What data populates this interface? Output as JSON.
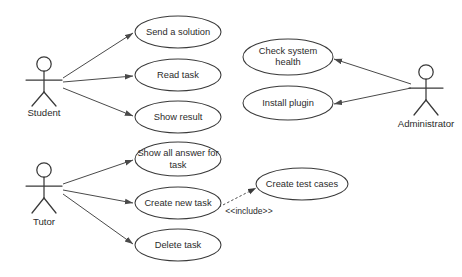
{
  "diagram": {
    "type": "uml-use-case-diagram",
    "background_color": "#ffffff",
    "stroke_color": "#3a3a3a",
    "text_color": "#2b2b2b",
    "actors": [
      {
        "id": "student",
        "label": "Student",
        "x": 44,
        "y": 78,
        "label_x": 44,
        "label_y": 113
      },
      {
        "id": "tutor",
        "label": "Tutor",
        "x": 44,
        "y": 183,
        "label_x": 44,
        "label_y": 222
      },
      {
        "id": "administrator",
        "label": "Administrator",
        "x": 426,
        "y": 85,
        "label_x": 426,
        "label_y": 124
      }
    ],
    "use_cases": [
      {
        "id": "send-a-solution",
        "label": "Send a solution",
        "lines": [
          "Send a solution"
        ],
        "cx": 178,
        "cy": 32,
        "rx": 43,
        "ry": 16
      },
      {
        "id": "read-task",
        "label": "Read task",
        "lines": [
          "Read task"
        ],
        "cx": 178,
        "cy": 75,
        "rx": 43,
        "ry": 16
      },
      {
        "id": "show-result",
        "label": "Show result",
        "lines": [
          "Show result"
        ],
        "cx": 178,
        "cy": 117,
        "rx": 43,
        "ry": 16
      },
      {
        "id": "check-system-health",
        "label": "Check system health",
        "lines": [
          "Check system",
          "health"
        ],
        "cx": 288,
        "cy": 57,
        "rx": 45,
        "ry": 18
      },
      {
        "id": "install-plugin",
        "label": "Install plugin",
        "lines": [
          "Install plugin"
        ],
        "cx": 288,
        "cy": 103,
        "rx": 45,
        "ry": 17
      },
      {
        "id": "show-all-answer-for-task",
        "label": "Show all answer for task",
        "lines": [
          "Show all answer for",
          "task"
        ],
        "cx": 178,
        "cy": 159,
        "rx": 43,
        "ry": 17
      },
      {
        "id": "create-new-task",
        "label": "Create new task",
        "lines": [
          "Create new task"
        ],
        "cx": 178,
        "cy": 203,
        "rx": 43,
        "ry": 16
      },
      {
        "id": "delete-task",
        "label": "Delete task",
        "lines": [
          "Delete task"
        ],
        "cx": 178,
        "cy": 245,
        "rx": 43,
        "ry": 16
      },
      {
        "id": "create-test-cases",
        "label": "Create test cases",
        "lines": [
          "Create test cases"
        ],
        "cx": 302,
        "cy": 184,
        "rx": 46,
        "ry": 16
      }
    ],
    "associations": [
      {
        "id": "student-to-send-a-solution",
        "from": "student",
        "to": "send-a-solution",
        "x1": 63,
        "y1": 78,
        "x2": 133,
        "y2": 33
      },
      {
        "id": "student-to-read-task",
        "from": "student",
        "to": "read-task",
        "x1": 63,
        "y1": 82,
        "x2": 133,
        "y2": 76
      },
      {
        "id": "student-to-show-result",
        "from": "student",
        "to": "show-result",
        "x1": 63,
        "y1": 88,
        "x2": 133,
        "y2": 116
      },
      {
        "id": "tutor-to-show-all-answer-for-task",
        "from": "tutor",
        "to": "show-all-answer-for-task",
        "x1": 63,
        "y1": 184,
        "x2": 133,
        "y2": 160
      },
      {
        "id": "tutor-to-create-new-task",
        "from": "tutor",
        "to": "create-new-task",
        "x1": 63,
        "y1": 190,
        "x2": 133,
        "y2": 203
      },
      {
        "id": "tutor-to-delete-task",
        "from": "tutor",
        "to": "delete-task",
        "x1": 63,
        "y1": 194,
        "x2": 133,
        "y2": 244
      },
      {
        "id": "administrator-to-check-system-health",
        "from": "administrator",
        "to": "check-system-health",
        "x1": 411,
        "y1": 84,
        "x2": 334,
        "y2": 59
      },
      {
        "id": "administrator-to-install-plugin",
        "from": "administrator",
        "to": "install-plugin",
        "x1": 411,
        "y1": 88,
        "x2": 334,
        "y2": 104
      }
    ],
    "include_relations": [
      {
        "id": "create-new-task-includes-create-test-cases",
        "from": "create-new-task",
        "to": "create-test-cases",
        "stereotype": "<<include>>",
        "x1": 219,
        "y1": 207,
        "x2": 256,
        "y2": 188,
        "label_x": 249,
        "label_y": 212
      }
    ]
  }
}
